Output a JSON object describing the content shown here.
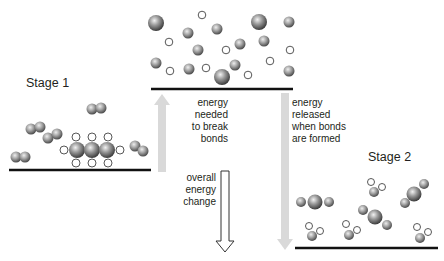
{
  "stages": {
    "stage1": "Stage 1",
    "stage2": "Stage 2"
  },
  "labels": {
    "break_bonds": [
      "energy",
      "needed",
      "to break",
      "bonds"
    ],
    "form_bonds": [
      "energy",
      "released",
      "when bonds",
      "are formed"
    ],
    "overall": [
      "overall",
      "energy",
      "change"
    ]
  },
  "colors": {
    "level_line": "#111111",
    "energy_arrow": "#d9d9d9",
    "atom_large": "#6e6e6e",
    "atom_medium": "#8a8a8a",
    "atom_small_stroke": "#555555"
  }
}
